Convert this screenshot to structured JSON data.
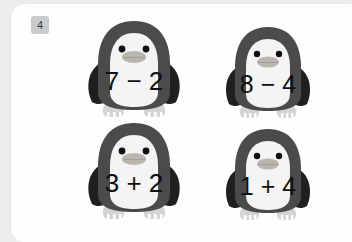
{
  "page": {
    "background_color": "#eceded",
    "card_color": "#fefefe"
  },
  "badge": {
    "label": "4",
    "background_color": "#c9cbcc",
    "text_color": "#3a3a3a"
  },
  "penguin_colors": {
    "body": "#4b4b4b",
    "wing": "#1f1f1f",
    "belly": "#f4f4f4",
    "beak": "#b9b6ae",
    "eye": "#111111",
    "feet": "#d3d4d4"
  },
  "problems": [
    {
      "id": "problem-1",
      "text": "7 − 2",
      "left": 7,
      "operator": "−",
      "right": 2,
      "answer": 5
    },
    {
      "id": "problem-2",
      "text": "8 − 4",
      "left": 8,
      "operator": "−",
      "right": 4,
      "answer": 4
    },
    {
      "id": "problem-3",
      "text": "3 + 2",
      "left": 3,
      "operator": "+",
      "right": 2,
      "answer": 5
    },
    {
      "id": "problem-4",
      "text": "1 + 4",
      "left": 1,
      "operator": "+",
      "right": 4,
      "answer": 5
    }
  ]
}
